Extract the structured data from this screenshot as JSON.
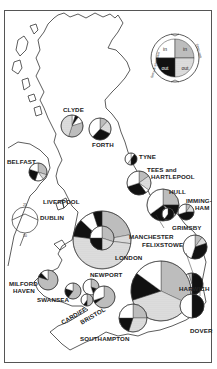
{
  "legend": {
    "quadrants": [
      {
        "position": "top-left",
        "label": "in",
        "fill": "white"
      },
      {
        "position": "top-right",
        "label": "in",
        "fill": "grey"
      },
      {
        "position": "bottom-left",
        "label": "out",
        "fill": "black"
      },
      {
        "position": "bottom-right",
        "label": "out",
        "fill": "dotted"
      }
    ],
    "left_arc_label": "ferry & short sea",
    "right_arc_label": "deep sea"
  },
  "scale_legend": {
    "top_label": "25",
    "bottom_label": "50"
  },
  "ports": [
    {
      "name": "CLYDE",
      "label": "CLYDE",
      "cx": 72,
      "cy": 126,
      "r": 11,
      "slices": [
        [
          "white",
          0.05
        ],
        [
          "black",
          0.05
        ],
        [
          "white",
          0.1
        ],
        [
          "grey",
          0.35
        ],
        [
          "dotted",
          0.45
        ]
      ]
    },
    {
      "name": "FORTH",
      "label": "FORTH",
      "cx": 100,
      "cy": 129,
      "r": 11,
      "slices": [
        [
          "grey",
          0.12
        ],
        [
          "dotted",
          0.2
        ],
        [
          "black",
          0.3
        ],
        [
          "white",
          0.38
        ]
      ]
    },
    {
      "name": "BELFAST",
      "label": "BELFAST",
      "cx": 38,
      "cy": 172,
      "r": 9,
      "slices": [
        [
          "grey",
          0.3
        ],
        [
          "dotted",
          0.1
        ],
        [
          "white",
          0.15
        ],
        [
          "black",
          0.25
        ],
        [
          "white",
          0.2
        ]
      ]
    },
    {
      "name": "TYNE",
      "label": "TYNE",
      "cx": 131,
      "cy": 159,
      "r": 6,
      "slices": [
        [
          "white",
          0.1
        ],
        [
          "black",
          0.4
        ],
        [
          "dotted",
          0.1
        ],
        [
          "white",
          0.4
        ]
      ]
    },
    {
      "name": "TEES and HARTLEPOOL",
      "label": "TEES and\nHARTLEPOOL",
      "cx": 139,
      "cy": 183,
      "r": 12,
      "slices": [
        [
          "grey",
          0.15
        ],
        [
          "dotted",
          0.2
        ],
        [
          "white",
          0.05
        ],
        [
          "black",
          0.3
        ],
        [
          "white",
          0.3
        ]
      ]
    },
    {
      "name": "LIVERPOOL",
      "label": "LIVERPOOL",
      "cx": 102,
      "cy": 240,
      "r": 29,
      "slices": [
        [
          "grey",
          0.22
        ],
        [
          "dotted",
          0.05
        ],
        [
          "white",
          0.0
        ],
        [
          "dotted",
          0.5
        ],
        [
          "black",
          0.1
        ],
        [
          "white",
          0.08
        ],
        [
          "black",
          0.05
        ]
      ]
    },
    {
      "name": "MANCHESTER",
      "label": "MANCHESTER",
      "cx": 102,
      "cy": 238,
      "r": 12,
      "slices": [
        [
          "grey",
          0.3
        ],
        [
          "dotted",
          0.2
        ],
        [
          "black",
          0.25
        ],
        [
          "white",
          0.25
        ]
      ]
    },
    {
      "name": "HULL",
      "label": "HULL",
      "cx": 163,
      "cy": 205,
      "r": 16,
      "slices": [
        [
          "grey",
          0.25
        ],
        [
          "black",
          0.1
        ],
        [
          "dotted",
          0.05
        ],
        [
          "black",
          0.25
        ],
        [
          "white",
          0.35
        ]
      ]
    },
    {
      "name": "GRIMSBY",
      "label": "GRIMSBY",
      "cx": 168,
      "cy": 214,
      "r": 6,
      "slices": [
        [
          "black",
          0.6
        ],
        [
          "white",
          0.4
        ]
      ]
    },
    {
      "name": "IMMINGHAM",
      "label": "IMMING-\nHAM",
      "cx": 186,
      "cy": 212,
      "r": 8,
      "slices": [
        [
          "grey",
          0.1
        ],
        [
          "dotted",
          0.15
        ],
        [
          "black",
          0.45
        ],
        [
          "white",
          0.3
        ]
      ]
    },
    {
      "name": "FELIXSTOWE",
      "label": "FELIXSTOWE",
      "cx": 195,
      "cy": 247,
      "r": 12,
      "slices": [
        [
          "grey",
          0.1
        ],
        [
          "dotted",
          0.1
        ],
        [
          "black",
          0.35
        ],
        [
          "white",
          0.45
        ]
      ]
    },
    {
      "name": "HARWICH",
      "label": "HARWICH",
      "cx": 192,
      "cy": 284,
      "r": 11,
      "slices": [
        [
          "black",
          0.5
        ],
        [
          "white",
          0.45
        ],
        [
          "grey",
          0.05
        ]
      ]
    },
    {
      "name": "LONDON",
      "label": "LONDON",
      "cx": 161,
      "cy": 291,
      "r": 30,
      "slices": [
        [
          "grey",
          0.32
        ],
        [
          "dotted",
          0.38
        ],
        [
          "black",
          0.15
        ],
        [
          "white",
          0.15
        ]
      ]
    },
    {
      "name": "DOVER",
      "label": "DOVER",
      "cx": 192,
      "cy": 306,
      "r": 12,
      "slices": [
        [
          "black",
          0.5
        ],
        [
          "white",
          0.5
        ]
      ]
    },
    {
      "name": "SOUTHAMPTON",
      "label": "SOUTHAMPTON",
      "cx": 133,
      "cy": 318,
      "r": 14,
      "slices": [
        [
          "grey",
          0.25
        ],
        [
          "dotted",
          0.3
        ],
        [
          "black",
          0.2
        ],
        [
          "white",
          0.25
        ]
      ]
    },
    {
      "name": "MILFORD HAVEN",
      "label": "MILFORD\nHAVEN",
      "cx": 48,
      "cy": 280,
      "r": 10,
      "slices": [
        [
          "grey",
          0.8
        ],
        [
          "black",
          0.08
        ],
        [
          "white",
          0.12
        ]
      ]
    },
    {
      "name": "SWANSEA",
      "label": "SWANSEA",
      "cx": 73,
      "cy": 291,
      "r": 8,
      "slices": [
        [
          "grey",
          0.6
        ],
        [
          "black",
          0.2
        ],
        [
          "white",
          0.2
        ]
      ]
    },
    {
      "name": "NEWPORT",
      "label": "NEWPORT",
      "cx": 91,
      "cy": 287,
      "r": 8,
      "slices": [
        [
          "grey",
          0.3
        ],
        [
          "black",
          0.15
        ],
        [
          "white",
          0.55
        ]
      ]
    },
    {
      "name": "CARDIFF",
      "label": "CARDIFF",
      "cx": 87,
      "cy": 300,
      "r": 6,
      "slices": [
        [
          "grey",
          0.5
        ],
        [
          "black",
          0.1
        ],
        [
          "white",
          0.4
        ]
      ]
    },
    {
      "name": "BRISTOL",
      "label": "BRISTOL",
      "cx": 104,
      "cy": 297,
      "r": 11,
      "slices": [
        [
          "grey",
          0.65
        ],
        [
          "black",
          0.05
        ],
        [
          "white",
          0.3
        ]
      ]
    }
  ],
  "labels": {
    "clyde": "CLYDE",
    "forth": "FORTH",
    "belfast": "BELFAST",
    "tyne": "TYNE",
    "tees_1": "TEES and",
    "tees_2": "HARTLEPOOL",
    "liverpool": "LIVERPOOL",
    "dublin": "DUBLIN",
    "hull": "HULL",
    "imming_1": "IMMING-",
    "imming_2": "HAM",
    "grimsby": "GRIMSBY",
    "manchester": "MANCHESTER",
    "felixstowe": "FELIXSTOWE",
    "london": "LONDON",
    "harwich": "HARWICH",
    "milford_1": "MILFORD",
    "milford_2": "HAVEN",
    "newport": "NEWPORT",
    "swansea": "SWANSEA",
    "cardiff": "CARDIFF",
    "bristol": "BRISTOL",
    "dover": "DOVER",
    "southampton": "SOUTHAMPTON"
  },
  "colors": {
    "ink": "#1a1a1a",
    "grey": "#bdbdbd",
    "dotted": "#d9d9d9",
    "frame": "#555555"
  }
}
